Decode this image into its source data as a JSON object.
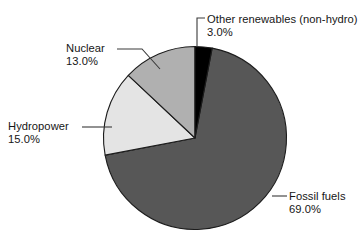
{
  "chart_data": {
    "type": "pie",
    "title": "",
    "subtitle": "",
    "xlabel": "",
    "ylabel": "",
    "units": "percent",
    "legend_position": "none",
    "grid": false,
    "start_angle_deg_from_top": 10.8,
    "direction": "clockwise",
    "categories": [
      "Fossil fuels",
      "Hydropower",
      "Nuclear",
      "Other renewables (non-hydro)"
    ],
    "values": [
      69.0,
      15.0,
      13.0,
      3.0
    ],
    "value_labels": [
      "69.0%",
      "15.0%",
      "13.0%",
      "3.0%"
    ],
    "colors": [
      "#575757",
      "#e4e4e4",
      "#b0b0b0",
      "#000000"
    ],
    "slices": [
      {
        "name": "Fossil fuels",
        "value": 69.0,
        "value_label": "69.0%",
        "color": "#575757"
      },
      {
        "name": "Hydropower",
        "value": 15.0,
        "value_label": "15.0%",
        "color": "#e4e4e4"
      },
      {
        "name": "Nuclear",
        "value": 13.0,
        "value_label": "13.0%",
        "color": "#b0b0b0"
      },
      {
        "name": "Other renewables (non-hydro)",
        "value": 3.0,
        "value_label": "3.0%",
        "color": "#000000"
      }
    ]
  },
  "labels": {
    "other_renewables": {
      "name": "Other renewables (non-hydro)",
      "pct": "3.0%"
    },
    "nuclear": {
      "name": "Nuclear",
      "pct": "13.0%"
    },
    "hydropower": {
      "name": "Hydropower",
      "pct": "15.0%"
    },
    "fossil_fuels": {
      "name": "Fossil fuels",
      "pct": "69.0%"
    }
  },
  "style": {
    "background": "#ffffff",
    "outline_color": "#1c1c1c",
    "leader_color": "#3a3a3a",
    "text_color": "#161616"
  }
}
